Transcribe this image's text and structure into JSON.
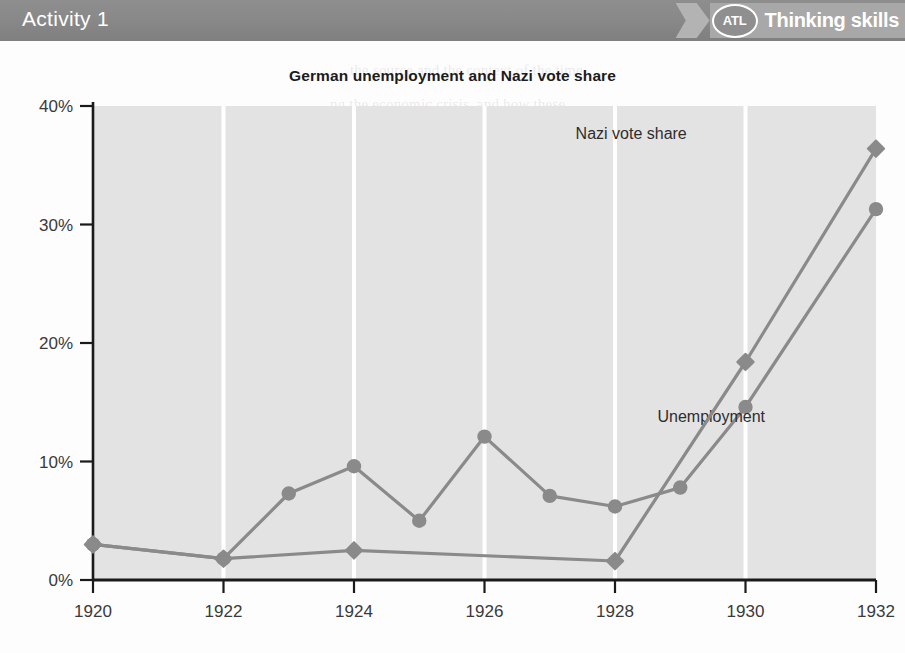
{
  "header": {
    "activity_title": "Activity 1",
    "atl_badge_text": "ATL",
    "atl_label": "Thinking skills",
    "bar_color": "#898989",
    "ribbon_color": "#a8a8a8"
  },
  "chart_data": {
    "type": "line",
    "title": "German unemployment and Nazi vote share",
    "xlabel": "",
    "ylabel": "",
    "xlim": [
      1920,
      1932
    ],
    "ylim": [
      0,
      40
    ],
    "y_tick_labels": [
      "0%",
      "10%",
      "20%",
      "30%",
      "40%"
    ],
    "y_ticks": [
      0,
      10,
      20,
      30,
      40
    ],
    "x_tick_labels": [
      "1920",
      "1922",
      "1924",
      "1926",
      "1928",
      "1930",
      "1932"
    ],
    "x_ticks": [
      1920,
      1922,
      1924,
      1926,
      1928,
      1930,
      1932
    ],
    "grid": "vertical-only",
    "grid_color": "#ffffff",
    "plot_background": "#e3e3e3",
    "line_color": "#8a8a8a",
    "legend_position": "inline-annotation",
    "series": [
      {
        "name": "Unemployment",
        "marker": "circle",
        "label_x": 1930.3,
        "label_y": 13.3,
        "x": [
          1920,
          1922,
          1923,
          1924,
          1925,
          1926,
          1927,
          1928,
          1929,
          1930,
          1932
        ],
        "values": [
          3.0,
          1.8,
          7.3,
          9.6,
          5.0,
          12.1,
          7.1,
          6.2,
          7.8,
          14.6,
          31.3
        ]
      },
      {
        "name": "Nazi vote share",
        "marker": "diamond",
        "label_x": 1929.1,
        "label_y": 37.2,
        "x": [
          1920,
          1922,
          1924,
          1928,
          1930,
          1932
        ],
        "values": [
          3.0,
          1.8,
          2.5,
          1.6,
          18.4,
          36.4
        ]
      }
    ]
  },
  "ghost_text": [
    {
      "x": 350,
      "y": 62,
      "text": "the source and the context of the time"
    },
    {
      "x": 330,
      "y": 96,
      "text": "ng the economic crisis, and how these",
      "size": 15
    },
    {
      "x": 330,
      "y": 121,
      "text": "onditions. Compare with the events of",
      "size": 15
    },
    {
      "x": 390,
      "y": 206,
      "text": "rled Japan during the 1930s",
      "size": 16
    },
    {
      "x": 300,
      "y": 272,
      "text": "of the period. Concentration of trade",
      "size": 15
    },
    {
      "x": 275,
      "y": 297,
      "text": "y the government plan. The US pattern",
      "size": 15
    },
    {
      "x": 245,
      "y": 322,
      "text": "er to a variety of sectors of the alliance, with",
      "size": 15
    },
    {
      "x": 270,
      "y": 347,
      "text": "to further prop up military power, and hence to",
      "size": 15
    },
    {
      "x": 255,
      "y": 372,
      "text": "h was by some writers of the period. The US pattern",
      "size": 15
    },
    {
      "x": 300,
      "y": 418,
      "text": "the state to develop military power and a stronger",
      "size": 15
    },
    {
      "x": 320,
      "y": 443,
      "text": "ing on Japanese expansion and the relations to the",
      "size": 15
    },
    {
      "x": 300,
      "y": 487,
      "text": "on to the military and the economic base of the",
      "size": 15
    },
    {
      "x": 320,
      "y": 512,
      "text": "power, and to the expansion of the state",
      "size": 15
    }
  ]
}
